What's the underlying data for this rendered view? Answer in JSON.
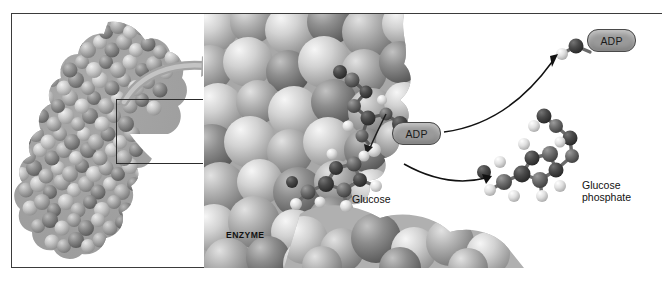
{
  "figure": {
    "background_color": "#ffffff",
    "frame_color": "#3b3b3b"
  },
  "panels": {
    "overview": {
      "name": "whole-enzyme-overview",
      "description": "Space-filling model of the entire enzyme molecule",
      "inset_box": {
        "label": "active-site-region",
        "x": 104,
        "y": 85,
        "width": 99,
        "height": 65,
        "border_color": "#2c2c2c"
      },
      "zoom_arrow": {
        "name": "magnification-arrow",
        "color": "#9d9d9d",
        "direction": "up-right"
      }
    },
    "detail": {
      "name": "active-site-closeup",
      "description": "Magnified view of the enzyme active site with bound substrates"
    }
  },
  "labels": {
    "enzyme": "ENZYME",
    "glucose": "Glucose",
    "adp_active_site": "ADP",
    "adp_released": "ADP",
    "glucose_phosphate_line1": "Glucose",
    "glucose_phosphate_line2": "phosphate"
  },
  "colors": {
    "pill_fill": "#9a9a9a",
    "pill_border": "#4a4a4a",
    "text": "#111111",
    "arrow_thin": "#111111",
    "arrow_thick": "#9d9d9d",
    "sphere_light": "#e9e9e9",
    "sphere_mid": "#b4b4b4",
    "sphere_dark": "#5f5f5f",
    "atom_carbon": "#6a6a6a",
    "atom_dark": "#3a3a3a",
    "atom_hydrogen": "#e4e4e4"
  },
  "reaction": {
    "substrates": [
      "Glucose",
      "ATP"
    ],
    "products": [
      "Glucose phosphate",
      "ADP"
    ],
    "arrows": [
      {
        "name": "adp-release-arrow",
        "from": "active site",
        "to": "ADP",
        "style": "curved-thin-black"
      },
      {
        "name": "product-release-arrow",
        "from": "active site",
        "to": "Glucose phosphate",
        "style": "curved-thin-black"
      },
      {
        "name": "phosphate-transfer-arrow",
        "from": "ATP terminal phosphate",
        "to": "Glucose",
        "style": "short-curved-black"
      }
    ]
  }
}
